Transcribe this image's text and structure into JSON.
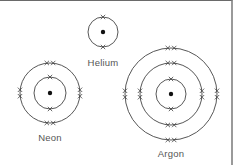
{
  "diagram": {
    "type": "electron-shell-diagrams",
    "colors": {
      "line": "#444444",
      "nucleus": "#111111",
      "label": "#555555",
      "background": "#ffffff"
    },
    "atoms": [
      {
        "name": "Helium",
        "label": "Helium",
        "center": [
          103,
          32
        ],
        "shell_radii": [
          15
        ],
        "electrons_per_shell": [
          2
        ],
        "label_pos": [
          103,
          66
        ]
      },
      {
        "name": "Neon",
        "label": "Neon",
        "center": [
          50,
          93
        ],
        "shell_radii": [
          16,
          30
        ],
        "electrons_per_shell": [
          2,
          8
        ],
        "label_pos": [
          50,
          141
        ]
      },
      {
        "name": "Argon",
        "label": "Argon",
        "center": [
          171,
          94
        ],
        "shell_radii": [
          15,
          31,
          46
        ],
        "electrons_per_shell": [
          2,
          8,
          8
        ],
        "label_pos": [
          171,
          157
        ]
      }
    ]
  }
}
